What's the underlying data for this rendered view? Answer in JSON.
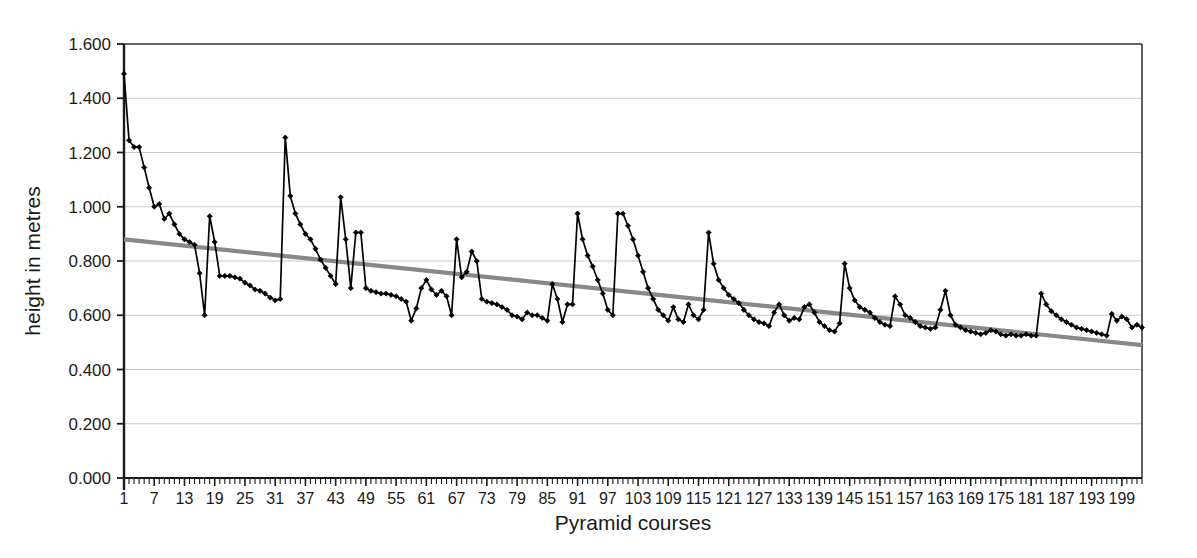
{
  "chart_data": {
    "type": "line",
    "title": "",
    "xlabel": "Pyramid courses",
    "ylabel": "height in metres",
    "xlim": [
      1,
      203
    ],
    "ylim": [
      0.0,
      1.6
    ],
    "grid": true,
    "legend": false,
    "y_ticks": [
      "0.000",
      "0.200",
      "0.400",
      "0.600",
      "0.800",
      "1.000",
      "1.200",
      "1.400",
      "1.600"
    ],
    "y_tick_values": [
      0.0,
      0.2,
      0.4,
      0.6,
      0.8,
      1.0,
      1.2,
      1.4,
      1.6
    ],
    "x_ticks": [
      1,
      7,
      13,
      19,
      25,
      31,
      37,
      43,
      49,
      55,
      61,
      67,
      73,
      79,
      85,
      91,
      97,
      103,
      109,
      115,
      121,
      127,
      133,
      139,
      145,
      151,
      157,
      163,
      169,
      175,
      181,
      187,
      193,
      199
    ],
    "x_tick_step": 6,
    "x_minor_tick_step": 1,
    "colors": {
      "series_line": "#000000",
      "series_marker": "#000000",
      "trendline": "#888888",
      "gridline": "#c8c8c8",
      "axis": "#1a1a1a",
      "background": "#ffffff"
    },
    "series": [
      {
        "name": "course height",
        "marker": "diamond",
        "x": [
          1,
          2,
          3,
          4,
          5,
          6,
          7,
          8,
          9,
          10,
          11,
          12,
          13,
          14,
          15,
          16,
          17,
          18,
          19,
          20,
          21,
          22,
          23,
          24,
          25,
          26,
          27,
          28,
          29,
          30,
          31,
          32,
          33,
          34,
          35,
          36,
          37,
          38,
          39,
          40,
          41,
          42,
          43,
          44,
          45,
          46,
          47,
          48,
          49,
          50,
          51,
          52,
          53,
          54,
          55,
          56,
          57,
          58,
          59,
          60,
          61,
          62,
          63,
          64,
          65,
          66,
          67,
          68,
          69,
          70,
          71,
          72,
          73,
          74,
          75,
          76,
          77,
          78,
          79,
          80,
          81,
          82,
          83,
          84,
          85,
          86,
          87,
          88,
          89,
          90,
          91,
          92,
          93,
          94,
          95,
          96,
          97,
          98,
          99,
          100,
          101,
          102,
          103,
          104,
          105,
          106,
          107,
          108,
          109,
          110,
          111,
          112,
          113,
          114,
          115,
          116,
          117,
          118,
          119,
          120,
          121,
          122,
          123,
          124,
          125,
          126,
          127,
          128,
          129,
          130,
          131,
          132,
          133,
          134,
          135,
          136,
          137,
          138,
          139,
          140,
          141,
          142,
          143,
          144,
          145,
          146,
          147,
          148,
          149,
          150,
          151,
          152,
          153,
          154,
          155,
          156,
          157,
          158,
          159,
          160,
          161,
          162,
          163,
          164,
          165,
          166,
          167,
          168,
          169,
          170,
          171,
          172,
          173,
          174,
          175,
          176,
          177,
          178,
          179,
          180,
          181,
          182,
          183,
          184,
          185,
          186,
          187,
          188,
          189,
          190,
          191,
          192,
          193,
          194,
          195,
          196,
          197,
          198,
          199,
          200,
          201,
          202,
          203
        ],
        "values": [
          1.49,
          1.245,
          1.22,
          1.22,
          1.145,
          1.07,
          1.0,
          1.01,
          0.955,
          0.975,
          0.935,
          0.9,
          0.88,
          0.87,
          0.86,
          0.755,
          0.6,
          0.965,
          0.87,
          0.745,
          0.745,
          0.745,
          0.74,
          0.735,
          0.72,
          0.71,
          0.695,
          0.69,
          0.68,
          0.665,
          0.655,
          0.66,
          1.255,
          1.04,
          0.975,
          0.935,
          0.9,
          0.88,
          0.845,
          0.805,
          0.775,
          0.745,
          0.715,
          1.035,
          0.88,
          0.7,
          0.905,
          0.905,
          0.7,
          0.69,
          0.685,
          0.68,
          0.68,
          0.675,
          0.67,
          0.66,
          0.65,
          0.58,
          0.625,
          0.7,
          0.73,
          0.695,
          0.675,
          0.69,
          0.67,
          0.6,
          0.88,
          0.74,
          0.76,
          0.835,
          0.8,
          0.66,
          0.65,
          0.645,
          0.64,
          0.63,
          0.62,
          0.6,
          0.595,
          0.585,
          0.61,
          0.6,
          0.6,
          0.59,
          0.58,
          0.715,
          0.66,
          0.575,
          0.64,
          0.64,
          0.975,
          0.88,
          0.82,
          0.78,
          0.73,
          0.68,
          0.62,
          0.6,
          0.975,
          0.975,
          0.93,
          0.88,
          0.82,
          0.76,
          0.7,
          0.66,
          0.62,
          0.6,
          0.58,
          0.63,
          0.585,
          0.575,
          0.64,
          0.6,
          0.585,
          0.62,
          0.905,
          0.79,
          0.73,
          0.7,
          0.675,
          0.66,
          0.645,
          0.62,
          0.6,
          0.585,
          0.575,
          0.57,
          0.56,
          0.61,
          0.64,
          0.6,
          0.58,
          0.59,
          0.585,
          0.63,
          0.64,
          0.61,
          0.575,
          0.56,
          0.545,
          0.54,
          0.57,
          0.79,
          0.7,
          0.655,
          0.63,
          0.62,
          0.61,
          0.59,
          0.575,
          0.565,
          0.56,
          0.67,
          0.64,
          0.6,
          0.59,
          0.575,
          0.56,
          0.555,
          0.55,
          0.555,
          0.62,
          0.69,
          0.6,
          0.565,
          0.555,
          0.545,
          0.54,
          0.535,
          0.53,
          0.535,
          0.545,
          0.54,
          0.53,
          0.525,
          0.53,
          0.525,
          0.525,
          0.53,
          0.525,
          0.525,
          0.68,
          0.64,
          0.615,
          0.6,
          0.585,
          0.575,
          0.565,
          0.555,
          0.55,
          0.545,
          0.54,
          0.535,
          0.53,
          0.525,
          0.605,
          0.58,
          0.595,
          0.585,
          0.555,
          0.565,
          0.555
        ]
      }
    ],
    "trendline": {
      "name": "linear trend",
      "x_start": 1,
      "x_end": 203,
      "y_start": 0.88,
      "y_end": 0.49,
      "color": "#888888"
    }
  }
}
